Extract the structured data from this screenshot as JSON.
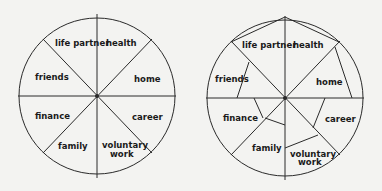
{
  "colors": {
    "background": "#f3f3f1",
    "stroke": "#2a2a2a",
    "text": "#1a1a1a"
  },
  "wheels": [
    {
      "id": "blank-wheel",
      "segments": {
        "life_partner": "life partner",
        "health": "health",
        "home": "home",
        "career": "career",
        "voluntary_work_1": "voluntary",
        "voluntary_work_2": "work",
        "family": "family",
        "finance": "finance",
        "friends": "friends"
      }
    },
    {
      "id": "scored-wheel",
      "segments": {
        "life_partner": "life partner",
        "health": "health",
        "home": "home",
        "career": "career",
        "voluntary_work_1": "voluntary",
        "voluntary_work_2": "work",
        "family": "family",
        "finance": "finance",
        "friends": "friends"
      }
    }
  ]
}
